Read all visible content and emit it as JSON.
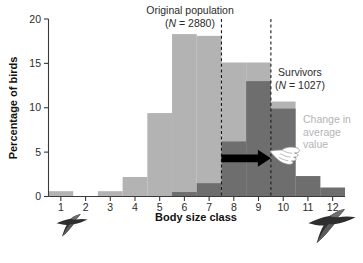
{
  "chart_data": {
    "type": "bar",
    "title": "",
    "xlabel": "Body size class",
    "ylabel": "Percentage of birds",
    "categories": [
      "1",
      "2",
      "3",
      "4",
      "5",
      "6",
      "7",
      "8",
      "9",
      "10",
      "11",
      "12"
    ],
    "xlim": [
      0.5,
      12.5
    ],
    "ylim": [
      0,
      20
    ],
    "yticks": [
      0,
      5,
      10,
      15,
      20
    ],
    "ytick_labels": [
      "0",
      "5",
      "10",
      "15",
      "20"
    ],
    "grid": false,
    "legend": "inline-annotations",
    "series": [
      {
        "name": "Original population",
        "color": "#b3b3b3",
        "values": [
          0.6,
          0,
          0.6,
          2.2,
          9.4,
          18.3,
          18.1,
          15.1,
          15.1,
          10.7,
          2.3,
          1.0
        ]
      },
      {
        "name": "Survivors",
        "color": "#6e6e6e",
        "values": [
          0,
          0,
          0,
          0,
          0,
          0.5,
          1.5,
          6.2,
          13.0,
          9.9,
          2.3,
          1.0
        ]
      }
    ],
    "annotations": [
      {
        "name": "original-population-label",
        "line1": "Original population",
        "line2_prefix": "(",
        "line2_italic": "N",
        "line2_suffix": " = 2880)",
        "text": "Original population (N = 2880)",
        "x": 190,
        "y": 14
      },
      {
        "name": "survivors-label",
        "line1": "Survivors",
        "line2_prefix": "(",
        "line2_italic": "N",
        "line2_suffix": " = 1027)",
        "text": "Survivors (N = 1027)",
        "x": 300,
        "y": 76
      },
      {
        "name": "change-in-average-label",
        "line1": "Change in",
        "line2": "average",
        "line3": "value",
        "text": "Change in average value",
        "x": 306,
        "y": 120
      }
    ],
    "reference_lines": [
      {
        "name": "original-mean-line",
        "x_class": 7.5,
        "style": "dashed",
        "label": "original population mean"
      },
      {
        "name": "survivors-mean-line",
        "x_class": 9.5,
        "style": "dashed",
        "label": "survivors mean"
      }
    ],
    "arrow": {
      "name": "change-arrow",
      "from_class": 7.5,
      "to_class": 9.5,
      "y_value": 4.3,
      "color": "#000000",
      "meaning": "Change in average value"
    },
    "decorations": [
      {
        "name": "small-bird-icon",
        "note": "small flying bird silhouette below class 1-2"
      },
      {
        "name": "large-bird-icon",
        "note": "larger flying bird silhouette below class 11-12"
      }
    ]
  },
  "colors": {
    "original_population": "#b3b3b3",
    "survivors": "#6e6e6e",
    "axis": "#3a3a3a",
    "arrow": "#000000",
    "annotation_light": "#b4b4b4",
    "background": "#ffffff"
  }
}
